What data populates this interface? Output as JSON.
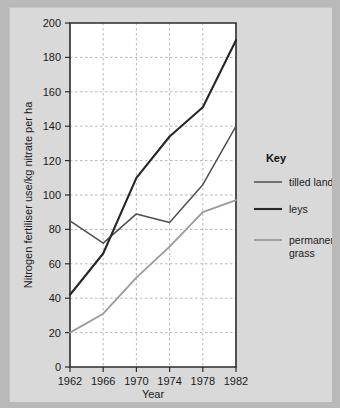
{
  "chart_data": {
    "type": "line",
    "title": "",
    "xlabel": "Year",
    "ylabel": "Nitrogen fertiliser use/kg nitrate per ha",
    "x": [
      1962,
      1966,
      1970,
      1974,
      1978,
      1982
    ],
    "xtick_labels": [
      "1962",
      "1966",
      "1970",
      "1974",
      "1978",
      "1982"
    ],
    "ytick_labels": [
      "0",
      "20",
      "40",
      "60",
      "80",
      "100",
      "120",
      "140",
      "160",
      "180",
      "200"
    ],
    "ylim": [
      0,
      200
    ],
    "ytick_step": 20,
    "grid": true,
    "legend_position": "right",
    "legend_title": "Key",
    "series": [
      {
        "name": "tilled land",
        "color": "#4f4f4f",
        "width": 1.5,
        "values": [
          85,
          72,
          89,
          84,
          106,
          140
        ]
      },
      {
        "name": "leys",
        "color": "#262626",
        "width": 2.1,
        "values": [
          42,
          66,
          110,
          134,
          151,
          190
        ]
      },
      {
        "name": "permanent grass",
        "color": "#9b9b9b",
        "width": 1.8,
        "values": [
          20,
          31,
          52,
          70,
          90,
          97
        ]
      }
    ]
  },
  "axes": {
    "x_title": "Year",
    "y_title": "Nitrogen fertiliser use/kg nitrate per ha"
  },
  "legend": {
    "title": "Key",
    "entries": [
      {
        "label": "tilled land"
      },
      {
        "label": "leys"
      },
      {
        "label": "permanent",
        "label2": "grass"
      }
    ]
  },
  "colors": {
    "page_background": "#b9b9b9",
    "figure_background": "#d9d9d9",
    "plot_background": "#ffffff",
    "grid": "#9a9a9a",
    "axis": "#2b2b2b",
    "tilled_land": "#4f4f4f",
    "leys": "#262626",
    "permanent_grass": "#9b9b9b"
  }
}
